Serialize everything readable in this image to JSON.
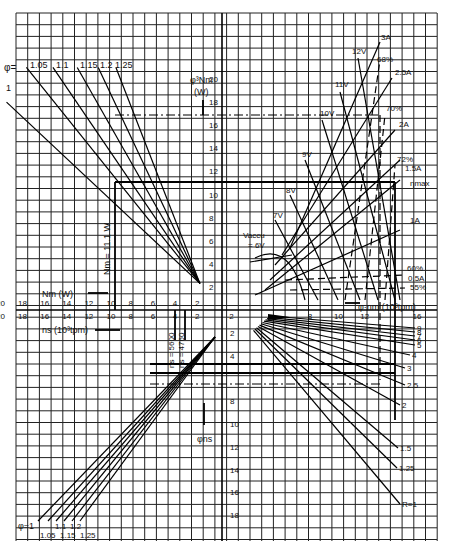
{
  "chart_data": {
    "type": "line",
    "title": "",
    "grid": true,
    "axes": {
      "top_center": {
        "label": "φ³Nm",
        "unit": "(W)",
        "ticks": [
          2,
          4,
          6,
          8,
          10,
          12,
          14,
          16,
          18,
          20
        ]
      },
      "left_upper": {
        "label": "Nm (W)",
        "ticks": [
          20,
          18,
          16,
          14,
          12,
          10,
          8,
          6,
          4,
          2
        ]
      },
      "left_lower": {
        "label": "ns (10³tpm)",
        "ticks": [
          20,
          18,
          16,
          14,
          12,
          10,
          8,
          6,
          4,
          2
        ]
      },
      "right": {
        "label": "φ·nm (10³tpm)",
        "ticks": [
          2,
          8,
          10,
          12,
          16
        ]
      },
      "bottom_center": {
        "label": "φns",
        "ticks": [
          2,
          4,
          8,
          10,
          12,
          14,
          16,
          18
        ]
      }
    },
    "quadrant_top_left": {
      "series_label": "φ=",
      "series": [
        {
          "name": "1",
          "from": [
            -19.5,
            18
          ],
          "to": [
            -2,
            2.3
          ]
        },
        {
          "name": "1.05",
          "from": [
            -17.7,
            21
          ],
          "to": [
            -2,
            2.3
          ]
        },
        {
          "name": "1.1",
          "from": [
            -15.3,
            21
          ],
          "to": [
            -2,
            2.3
          ]
        },
        {
          "name": "1.15",
          "from": [
            -13.1,
            21
          ],
          "to": [
            -2,
            2.3
          ]
        },
        {
          "name": "1.2",
          "from": [
            -11.2,
            21
          ],
          "to": [
            -2,
            2.3
          ]
        },
        {
          "name": "1.25",
          "from": [
            -9.6,
            21
          ],
          "to": [
            -2,
            2.3
          ]
        }
      ],
      "annotation": "Nm = 11.1 W"
    },
    "quadrant_top_right": {
      "voltage_lines": [
        "Vaccu = 6V",
        "7V",
        "8V",
        "9V",
        "10V",
        "11V",
        "12V"
      ],
      "current_lines": [
        "0.5A",
        "1A",
        "1.5A",
        "2A",
        "2.5A",
        "3A"
      ],
      "efficiency_lines": [
        "55%",
        "60%",
        "68%",
        "70%",
        "72%"
      ],
      "annotation": "ηmax"
    },
    "quadrant_bottom_right": {
      "series_label": "R",
      "series": [
        "9",
        "8",
        "7",
        "6",
        "5",
        "4",
        "3",
        "2.5",
        "2",
        "1.5",
        "1.25",
        "R=1"
      ]
    },
    "quadrant_bottom_left": {
      "series_label": "φ=",
      "series": [
        "1",
        "1.05",
        "1.1",
        "1.15",
        "1.2",
        "1.25"
      ],
      "annotations": [
        "ns = 5600",
        "ns = 4760"
      ]
    },
    "reference_lines": [
      {
        "type": "dash-dot",
        "y": 17,
        "from_x": -10,
        "to_x": 13.5
      },
      {
        "type": "solid",
        "y": 11.1,
        "from_x": -10,
        "to_x": 14.5
      },
      {
        "type": "solid-vertical",
        "x": -10,
        "from_y": 0,
        "to_y": 11.1
      }
    ]
  },
  "labels": {
    "phi_eq_top": "φ=",
    "phi_top": [
      "1",
      "1.05",
      "1.1",
      "1.15",
      "1.2",
      "1.25"
    ],
    "phi3nm": "φ³Nm",
    "phi3nm_unit": "(W)",
    "nm_axis": "Nm (W)",
    "ns_axis": "ns (10³tpm)",
    "phinm_axis": "φ·nm (10³tpm)",
    "phins_axis": "φns",
    "nm_note": "Nm = 11.1 W",
    "ns5600": "ns = 5600",
    "ns4760": "ns = 4760",
    "vaccu": "Vaccu",
    "vaccu2": "= 6V",
    "v7": "7V",
    "v8": "8V",
    "v9": "9V",
    "v10": "10V",
    "v11": "11V",
    "v12": "12V",
    "a3": "3A",
    "a25": "2.5A",
    "a2": "2A",
    "a15": "1.5A",
    "a1": "1A",
    "a05": "0.5A",
    "e68": "68%",
    "e70": "70%",
    "e72": "72%",
    "e60": "60%",
    "e55": "55%",
    "etamax": "ηmax",
    "r_labels": [
      "9",
      "8",
      "7",
      "6",
      "5",
      "4",
      "3",
      "2.5",
      "2",
      "1.5",
      "1.25",
      "R=1"
    ],
    "phi_eq_bottom": "φ=1",
    "phi_bottom_top": [
      "1.1",
      "1.2"
    ],
    "phi_bottom_low": [
      "1.05",
      "1.15",
      "1.25"
    ]
  }
}
